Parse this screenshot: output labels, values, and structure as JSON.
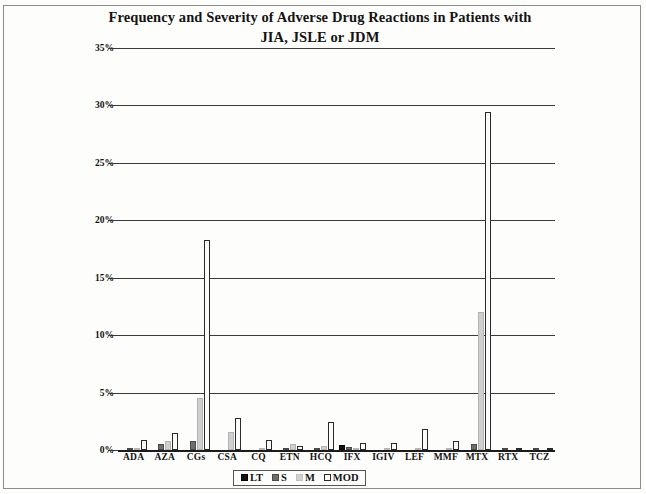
{
  "page": {
    "border_color": "#8d8d8d",
    "background": "#fdfdfb"
  },
  "chart_data": {
    "type": "bar",
    "title": "Frequency and Severity of Adverse Drug Reactions in Patients with JIA, JSLE or JDM",
    "title_line1": "Frequency and Severity of Adverse Drug Reactions in Patients with",
    "title_line2": "JIA, JSLE or JDM",
    "xlabel": "",
    "ylabel": "",
    "ylim": [
      0,
      35
    ],
    "ytick_step": 5,
    "ytick_labels": [
      "0%",
      "5%",
      "10%",
      "15%",
      "20%",
      "25%",
      "30%",
      "35%"
    ],
    "ytick_values": [
      0,
      5,
      10,
      15,
      20,
      25,
      30,
      35
    ],
    "grid": true,
    "grid_axis": "y",
    "legend_position": "bottom",
    "categories": [
      "ADA",
      "AZA",
      "CGs",
      "CSA",
      "CQ",
      "ETN",
      "HCQ",
      "IFX",
      "IGIV",
      "LEF",
      "MMF",
      "MTX",
      "RTX",
      "TCZ"
    ],
    "series": [
      {
        "name": "LT",
        "color": "#121212",
        "values": [
          0,
          0,
          0,
          0,
          0,
          0,
          0,
          0.45,
          0,
          0,
          0,
          0,
          0,
          0
        ]
      },
      {
        "name": "S",
        "color": "#6e6e6e",
        "values": [
          0.12,
          0.5,
          0.8,
          0,
          0,
          0.15,
          0.2,
          0.3,
          0,
          0,
          0,
          0.55,
          0.12,
          0.12
        ]
      },
      {
        "name": "M",
        "color": "#cfcfcf",
        "values": [
          0.2,
          0.75,
          4.5,
          1.6,
          0.15,
          0.55,
          0.35,
          0.2,
          0.1,
          0.1,
          0.15,
          12.0,
          0,
          0
        ]
      },
      {
        "name": "MOD",
        "color": "#fbfbfb",
        "values": [
          0.9,
          1.5,
          18.3,
          2.8,
          0.9,
          0.35,
          2.4,
          0.65,
          0.6,
          1.8,
          0.75,
          29.4,
          0.15,
          0.15
        ]
      }
    ],
    "legend": [
      {
        "label": "LT",
        "key": "lt"
      },
      {
        "label": "S",
        "key": "s"
      },
      {
        "label": "M",
        "key": "m"
      },
      {
        "label": "MOD",
        "key": "mod"
      }
    ]
  }
}
